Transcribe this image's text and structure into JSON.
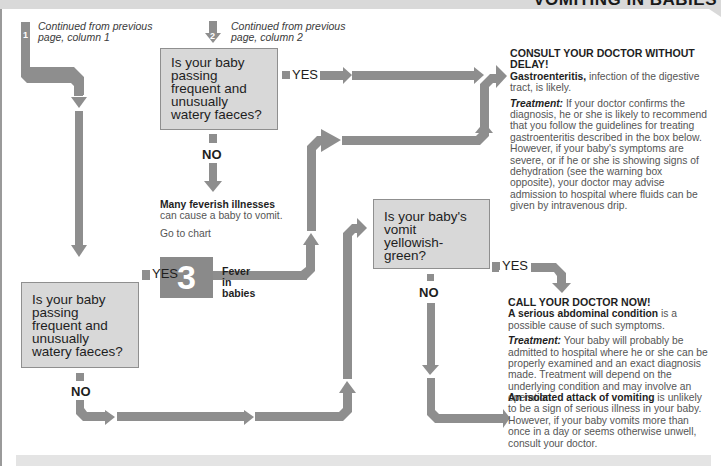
{
  "header": {
    "title": "VOMITING IN BABIES"
  },
  "continuations": [
    {
      "number": "1",
      "text": "Continued from previous page, column 1"
    },
    {
      "number": "2",
      "text": "Continued from previous page, column 2"
    }
  ],
  "questions": {
    "q_top": "Is your baby passing frequent and unusually watery faeces?",
    "q_left": "Is your baby passing frequent and unusually watery faeces?",
    "q_mid": "Is your baby's vomit yellowish-green?"
  },
  "labels": {
    "yes": "YES",
    "no": "NO"
  },
  "feverish": {
    "bold": "Many feverish illnesses",
    "text": "can cause a baby to vomit.",
    "go_to": "Go to chart",
    "chart_number": "3",
    "chart_title": "Fever in babies"
  },
  "outcomes": {
    "gastro": {
      "heading": "CONSULT YOUR DOCTOR WITHOUT DELAY!",
      "cause_bold": "Gastroenteritis,",
      "cause_text": " infection of the digestive tract, is likely.",
      "treatment_label": "Treatment:",
      "treatment_text": " If your doctor confirms the diagnosis, he or she is likely to recommend that you follow the guidelines for treating gastroenteritis described in the box below. However, if your baby's symptoms are severe, or if he or she is showing signs of dehydration (see the warning box opposite), your doctor may advise admission to hospital where fluids can be given by intravenous drip."
    },
    "abdominal": {
      "heading": "CALL YOUR DOCTOR NOW!",
      "cause_bold": "A serious abdominal condition",
      "cause_text": " is a possible cause of such symptoms.",
      "treatment_label": "Treatment:",
      "treatment_text": " Your baby will probably be admitted to hospital where he or she can be properly examined and an exact diagnosis made. Treatment will depend on the underlying condition and may involve an operation."
    },
    "isolated": {
      "cause_bold": "An isolated attack of vomiting",
      "cause_text": " is unlikely to be a sign of serious illness in your baby. However, if your baby vomits more than once in a day or seems otherwise unwell, consult your doctor."
    }
  },
  "colors": {
    "pipe": "#8e8e8e",
    "question_box": "#d8d8d8",
    "header_band": "#d9d9d9"
  }
}
